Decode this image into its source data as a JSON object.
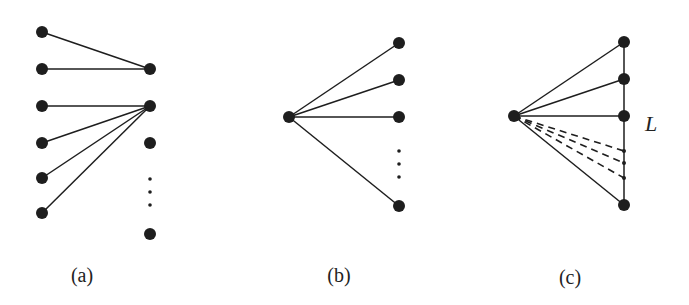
{
  "figure": {
    "width": 689,
    "height": 305,
    "colors": {
      "ink": "#1e1e1e",
      "background": "#ffffff"
    },
    "panels": [
      {
        "id": "a",
        "label": "(a)",
        "label_pos": [
          82,
          282
        ],
        "nodes": [
          {
            "id": "a-l1",
            "x": 42,
            "y": 32,
            "r": 6
          },
          {
            "id": "a-l2",
            "x": 42,
            "y": 69,
            "r": 6
          },
          {
            "id": "a-l3",
            "x": 42,
            "y": 106,
            "r": 6
          },
          {
            "id": "a-l4",
            "x": 42,
            "y": 143,
            "r": 6
          },
          {
            "id": "a-l5",
            "x": 42,
            "y": 178,
            "r": 6
          },
          {
            "id": "a-l6",
            "x": 42,
            "y": 213,
            "r": 6
          },
          {
            "id": "a-r1",
            "x": 150,
            "y": 69,
            "r": 6
          },
          {
            "id": "a-r2",
            "x": 150,
            "y": 106,
            "r": 6
          },
          {
            "id": "a-r3",
            "x": 150,
            "y": 143,
            "r": 6
          },
          {
            "id": "a-r4",
            "x": 150,
            "y": 234,
            "r": 6
          }
        ],
        "ellipsis_dots": [
          {
            "x": 150,
            "y": 179
          },
          {
            "x": 150,
            "y": 192
          },
          {
            "x": 150,
            "y": 205
          }
        ],
        "edges": [
          {
            "from": "a-l1",
            "to": "a-r1",
            "style": "solid"
          },
          {
            "from": "a-l2",
            "to": "a-r1",
            "style": "solid"
          },
          {
            "from": "a-l3",
            "to": "a-r2",
            "style": "solid"
          },
          {
            "from": "a-l4",
            "to": "a-r2",
            "style": "solid"
          },
          {
            "from": "a-l5",
            "to": "a-r2",
            "style": "solid"
          },
          {
            "from": "a-l6",
            "to": "a-r2",
            "style": "solid"
          }
        ]
      },
      {
        "id": "b",
        "label": "(b)",
        "label_pos": [
          339,
          282
        ],
        "nodes": [
          {
            "id": "b-hub",
            "x": 289,
            "y": 117,
            "r": 6
          },
          {
            "id": "b-r1",
            "x": 399,
            "y": 43,
            "r": 6
          },
          {
            "id": "b-r2",
            "x": 399,
            "y": 80,
            "r": 6
          },
          {
            "id": "b-r3",
            "x": 399,
            "y": 117,
            "r": 6
          },
          {
            "id": "b-r4",
            "x": 399,
            "y": 206,
            "r": 6
          }
        ],
        "ellipsis_dots": [
          {
            "x": 399,
            "y": 151
          },
          {
            "x": 399,
            "y": 164
          },
          {
            "x": 399,
            "y": 177
          }
        ],
        "edges": [
          {
            "from": "b-hub",
            "to": "b-r1",
            "style": "solid"
          },
          {
            "from": "b-hub",
            "to": "b-r2",
            "style": "solid"
          },
          {
            "from": "b-hub",
            "to": "b-r3",
            "style": "solid"
          },
          {
            "from": "b-hub",
            "to": "b-r4",
            "style": "solid"
          }
        ]
      },
      {
        "id": "c",
        "label": "(c)",
        "label_pos": [
          570,
          284
        ],
        "line_label": "L",
        "line_label_pos": [
          645,
          131
        ],
        "nodes": [
          {
            "id": "c-hub",
            "x": 514,
            "y": 116,
            "r": 6
          },
          {
            "id": "c-r1",
            "x": 624,
            "y": 42,
            "r": 6
          },
          {
            "id": "c-r2",
            "x": 624,
            "y": 79,
            "r": 6
          },
          {
            "id": "c-r3",
            "x": 624,
            "y": 116,
            "r": 6
          },
          {
            "id": "c-r4",
            "x": 624,
            "y": 205,
            "r": 6
          },
          {
            "id": "c-s1",
            "x": 624,
            "y": 151,
            "r": 2
          },
          {
            "id": "c-s2",
            "x": 624,
            "y": 163,
            "r": 2
          },
          {
            "id": "c-s3",
            "x": 624,
            "y": 178,
            "r": 2
          }
        ],
        "edges": [
          {
            "from": "c-r1",
            "to": "c-r4",
            "style": "solid"
          },
          {
            "from": "c-hub",
            "to": "c-r1",
            "style": "solid"
          },
          {
            "from": "c-hub",
            "to": "c-r2",
            "style": "solid"
          },
          {
            "from": "c-hub",
            "to": "c-r3",
            "style": "solid"
          },
          {
            "from": "c-hub",
            "to": "c-r4",
            "style": "solid"
          },
          {
            "from": "c-hub",
            "to": "c-s1",
            "style": "dashed"
          },
          {
            "from": "c-hub",
            "to": "c-s2",
            "style": "dashed"
          },
          {
            "from": "c-hub",
            "to": "c-s3",
            "style": "dashed"
          }
        ]
      }
    ]
  }
}
